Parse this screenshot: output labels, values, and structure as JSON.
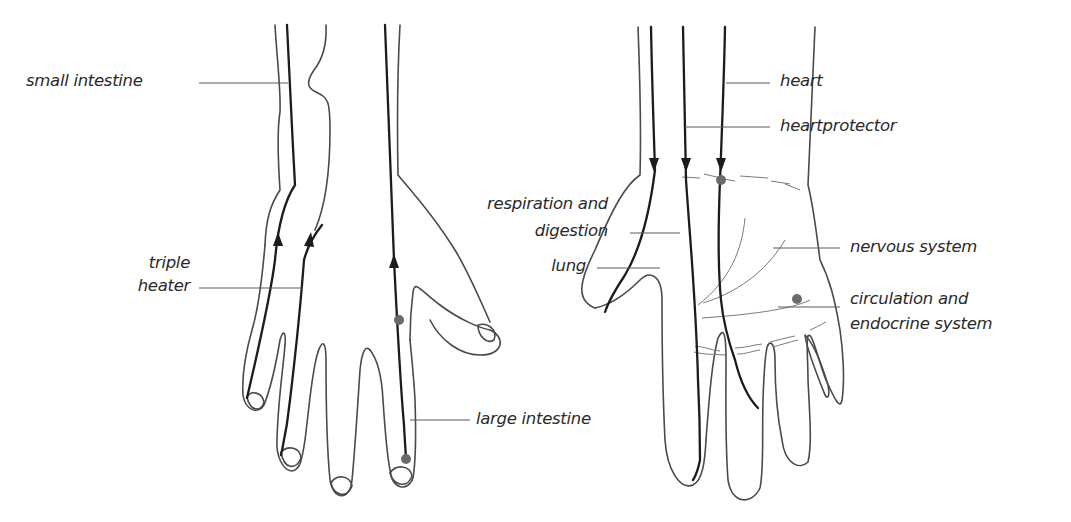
{
  "diagram": {
    "type": "anatomical meridian diagram",
    "colors": {
      "outline": "#4a4a4a",
      "meridian": "#1c1c1c",
      "point": "#6a6a6a",
      "text": "#2a2a2a",
      "background": "#ffffff"
    },
    "left_hand": {
      "view": "back of hand",
      "labels": {
        "small_intestine": "small intestine",
        "triple_heater_1": "triple",
        "triple_heater_2": "heater",
        "large_intestine": "large intestine"
      },
      "meridian_direction": "upward"
    },
    "right_hand": {
      "view": "palm",
      "labels": {
        "heart": "heart",
        "heartprotector": "heartprotector",
        "respiration_1": "respiration and",
        "respiration_2": "digestion",
        "lung": "lung",
        "nervous_system": "nervous system",
        "circulation_1": "circulation and",
        "circulation_2": "endocrine system"
      },
      "meridian_direction": "downward"
    }
  }
}
